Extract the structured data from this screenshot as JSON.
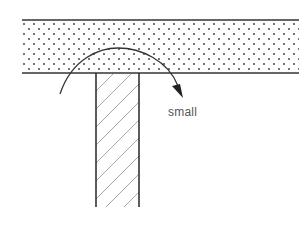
{
  "diagram": {
    "title": "",
    "labels": {
      "rotation_label": "small"
    },
    "elements": {
      "slab": {
        "description": "horizontal dotted (stippled) layer",
        "fill_pattern": "dots",
        "x_left": 22,
        "x_right": 299,
        "y_top": 20,
        "y_bottom": 73
      },
      "column": {
        "description": "vertical hatched member below slab",
        "fill_pattern": "diagonal-hatch",
        "x_left": 96,
        "x_right": 139,
        "y_top": 73,
        "y_bottom": 207
      },
      "rotation_arrow": {
        "description": "curved arrow over the joint, clockwise",
        "direction": "clockwise",
        "start": [
          60,
          94
        ],
        "peak": [
          118,
          48
        ],
        "end": [
          183,
          97
        ]
      }
    },
    "colors": {
      "line": "#333333",
      "dots": "#555555",
      "hatch": "#9a9a9a",
      "text": "#555555",
      "background": "#ffffff"
    }
  }
}
